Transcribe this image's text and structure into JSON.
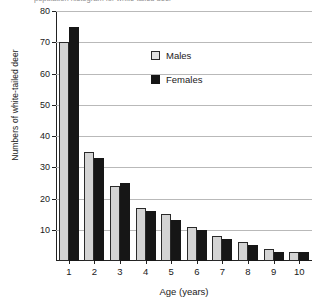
{
  "chart_data": {
    "type": "bar",
    "title": "population histogram for white-tailed deer",
    "xlabel": "Age (years)",
    "ylabel": "Numbers of white-tailed deer",
    "categories": [
      "1",
      "2",
      "3",
      "4",
      "5",
      "6",
      "7",
      "8",
      "9",
      "10"
    ],
    "series": [
      {
        "name": "Males",
        "color": "#d4d4d4",
        "values": [
          70,
          35,
          24,
          17,
          15,
          11,
          8,
          6,
          4,
          3
        ]
      },
      {
        "name": "Females",
        "color": "#161616",
        "values": [
          75,
          33,
          25,
          16,
          13,
          10,
          7,
          5,
          3,
          3
        ]
      }
    ],
    "ylim": [
      0,
      80
    ],
    "yticks": [
      "10",
      "20",
      "30",
      "40",
      "50",
      "60",
      "70",
      "80"
    ],
    "grid": true,
    "legend_position": "top-center"
  }
}
